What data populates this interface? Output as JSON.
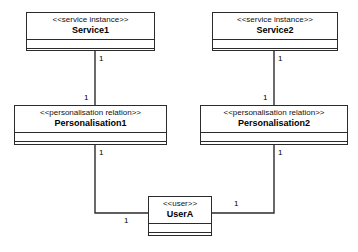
{
  "diagram": {
    "type": "uml-class-diagram",
    "width": 358,
    "height": 252,
    "background": "#ffffff",
    "line_color": "#2b2b2b",
    "text_color": "#000000"
  },
  "classes": [
    {
      "id": "service1",
      "stereotype": "<<service instance>>",
      "name": "Service1",
      "x": 26,
      "y": 12,
      "w": 129,
      "h": 39
    },
    {
      "id": "service2",
      "stereotype": "<<service instance>>",
      "name": "Service2",
      "x": 212,
      "y": 12,
      "w": 126,
      "h": 39
    },
    {
      "id": "personalisation1",
      "stereotype": "<<personalisation relation>>",
      "name": "Personalisation1",
      "x": 14,
      "y": 105,
      "w": 153,
      "h": 40
    },
    {
      "id": "personalisation2",
      "stereotype": "<<personalisation relation>>",
      "name": "Personalisation2",
      "x": 200,
      "y": 105,
      "w": 148,
      "h": 40
    },
    {
      "id": "usera",
      "stereotype": "<<user>>",
      "name": "UserA",
      "x": 148,
      "y": 196,
      "w": 64,
      "h": 40
    }
  ],
  "associations": [
    {
      "id": "assoc-service1-personalisation1",
      "from": "service1",
      "to": "personalisation1",
      "points": "95,51 95,105",
      "from_multiplicity": "1",
      "to_multiplicity": "1"
    },
    {
      "id": "assoc-service2-personalisation2",
      "from": "service2",
      "to": "personalisation2",
      "points": "274,51 274,105",
      "from_multiplicity": "1",
      "to_multiplicity": "1"
    },
    {
      "id": "assoc-personalisation1-usera",
      "from": "personalisation1",
      "to": "usera",
      "points": "95,145 95,213 148,213",
      "from_multiplicity": "1",
      "to_multiplicity": "1"
    },
    {
      "id": "assoc-personalisation2-usera",
      "from": "personalisation2",
      "to": "usera",
      "points": "274,145 274,213 212,213",
      "from_multiplicity": "1",
      "to_multiplicity": "1"
    }
  ],
  "multiplicity_labels": [
    {
      "id": "mult-service1-bottom",
      "text": "1",
      "x": 99,
      "y": 54
    },
    {
      "id": "mult-personalisation1-top",
      "text": "1",
      "x": 84,
      "y": 93
    },
    {
      "id": "mult-service2-bottom",
      "text": "1",
      "x": 278,
      "y": 54
    },
    {
      "id": "mult-personalisation2-top",
      "text": "1",
      "x": 263,
      "y": 93
    },
    {
      "id": "mult-personalisation1-bottom",
      "text": "1",
      "x": 99,
      "y": 148
    },
    {
      "id": "mult-usera-left",
      "text": "1",
      "x": 124,
      "y": 216
    },
    {
      "id": "mult-personalisation2-bottom",
      "text": "1",
      "x": 278,
      "y": 148
    },
    {
      "id": "mult-usera-right",
      "text": "1",
      "x": 234,
      "y": 199
    }
  ]
}
